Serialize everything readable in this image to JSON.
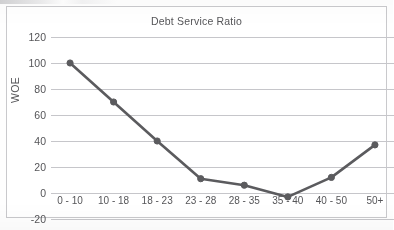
{
  "chart_data": {
    "type": "line",
    "title": "Debt Service Ratio",
    "xlabel": "",
    "ylabel": "WOE",
    "categories": [
      "0 - 10",
      "10 - 18",
      "18 - 23",
      "23 - 28",
      "28 - 35",
      "35 - 40",
      "40 - 50",
      "50+"
    ],
    "values": [
      100,
      70,
      40,
      11,
      6,
      -3,
      12,
      37
    ],
    "series": [
      {
        "name": "WOE",
        "values": [
          100,
          70,
          40,
          11,
          6,
          -3,
          12,
          37
        ]
      }
    ],
    "ylim": [
      -20,
      120
    ],
    "yticks": [
      120,
      100,
      80,
      60,
      40,
      20,
      0,
      -20
    ],
    "ytick_labels": [
      "120",
      "100",
      "80",
      "60",
      "40",
      "20",
      "0",
      "-20"
    ],
    "grid": "horizontal",
    "legend": "none",
    "line_color": "#5b5b5e",
    "marker": "circle",
    "marker_color": "#5b5b5e",
    "gridline_color": "#c6c6ca",
    "background_color": "#ffffff"
  },
  "figure": {
    "title": "Debt Service Ratio",
    "y_axis_title": "WOE"
  }
}
